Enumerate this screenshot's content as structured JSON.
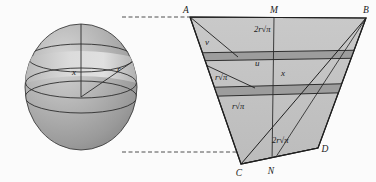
{
  "figure": {
    "background_color": "#fbfbfb",
    "stroke_color": "#1a1a1a",
    "palette": {
      "sphere_light": "#c9c9c9",
      "sphere_mid": "#a8a8a8",
      "sphere_dark": "#8d8d8d",
      "band_light": "#d8d8d8",
      "trapezoid_fill": "#c2c2c2",
      "band_dark": "#9a9a9a",
      "triangle_fill": "#b5b5b5",
      "dashed_color": "#3a3a3a"
    }
  },
  "sphere": {
    "name": "sphere-with-zone-band",
    "center_x": 81,
    "center_y": 87,
    "radius_x": 56,
    "radius_y": 63,
    "labels": [
      {
        "id": "x",
        "text": "x",
        "x": 72,
        "y": 75,
        "style": "var"
      },
      {
        "id": "r",
        "text": "r",
        "x": 117,
        "y": 72,
        "style": "var"
      }
    ],
    "band_top_y": 58,
    "band_bottom_y": 83,
    "equator_y": 97
  },
  "trapezoid": {
    "name": "trapezoid-construction",
    "vertices": {
      "A": {
        "label": "A",
        "x": 190,
        "y": 17,
        "label_x": 188,
        "label_y": 13
      },
      "B": {
        "label": "B",
        "x": 366,
        "y": 18,
        "label_x": 364,
        "label_y": 13
      },
      "C": {
        "label": "C",
        "x": 241,
        "y": 164,
        "label_x": 238,
        "label_y": 174
      },
      "D": {
        "label": "D",
        "x": 318,
        "y": 148,
        "label_x": 322,
        "label_y": 150
      },
      "M": {
        "label": "M",
        "x": 274,
        "y": 17,
        "label_x": 271,
        "label_y": 13
      },
      "N": {
        "label": "N",
        "x": 272,
        "y": 163,
        "label_x": 269,
        "label_y": 173
      }
    },
    "labels": [
      {
        "id": "top-width",
        "text": "2r√π",
        "x": 254,
        "y": 32,
        "style": "expr"
      },
      {
        "id": "u",
        "text": "u",
        "x": 257,
        "y": 64,
        "style": "var"
      },
      {
        "id": "x",
        "text": "x",
        "x": 280,
        "y": 74,
        "style": "var"
      },
      {
        "id": "r-sqrt-pi-up",
        "text": "r√π",
        "x": 223,
        "y": 79,
        "style": "expr"
      },
      {
        "id": "v",
        "text": "v",
        "x": 207,
        "y": 43,
        "style": "var"
      },
      {
        "id": "r-sqrt-pi-lo",
        "text": "r√π",
        "x": 240,
        "y": 107,
        "style": "expr"
      },
      {
        "id": "bottom-width",
        "text": "2r√π",
        "x": 279,
        "y": 141,
        "style": "expr"
      }
    ],
    "band_upper": {
      "y_left_top": 53,
      "y_right_top": 50,
      "y_left_bot": 61,
      "y_right_bot": 58
    },
    "band_lower": {
      "y_left_top": 88,
      "y_right_top": 83,
      "y_left_bot": 97,
      "y_right_bot": 92
    }
  },
  "connectors": {
    "top_dashed": {
      "name": "top-dashed-connector",
      "x1": 122,
      "y1": 17,
      "x2": 189,
      "y2": 17
    },
    "bottom_dashed": {
      "name": "bottom-dashed-connector",
      "x1": 122,
      "y1": 152,
      "x2": 248,
      "y2": 152
    }
  }
}
